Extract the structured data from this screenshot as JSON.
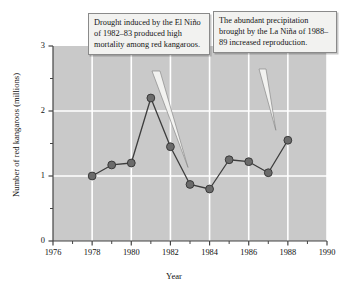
{
  "chart_data": {
    "type": "line",
    "title": "",
    "xlabel": "Year",
    "ylabel": "Number of red kangaroos (millions)",
    "xlim": [
      1976,
      1990
    ],
    "ylim": [
      0,
      3
    ],
    "grid": true,
    "legend": "none",
    "x_major_ticks": [
      1976,
      1978,
      1980,
      1982,
      1984,
      1986,
      1988,
      1990
    ],
    "x_minor_ticks": [
      1977,
      1979,
      1981,
      1983,
      1985,
      1987,
      1989
    ],
    "x_tick_labels": [
      "1976",
      "1978",
      "1980",
      "1982",
      "1984",
      "1986",
      "1988",
      "1990"
    ],
    "y_major_ticks": [
      0,
      1,
      2,
      3
    ],
    "y_minor_ticks": [
      0.5,
      1.5,
      2.5
    ],
    "y_tick_labels": [
      "0",
      "1",
      "2",
      "3"
    ],
    "marker_color": "#6b6b6b",
    "line_color": "#3d3d3d",
    "plot_background": "#c9c9c9",
    "gridline_color": "#ffffff",
    "x": [
      1978,
      1979,
      1980,
      1981,
      1982,
      1983,
      1984,
      1985,
      1986,
      1987,
      1988
    ],
    "values": [
      1.0,
      1.17,
      1.2,
      2.2,
      1.45,
      0.87,
      0.8,
      1.25,
      1.22,
      1.05,
      1.55
    ],
    "series": [
      {
        "name": "Red kangaroo population",
        "values": [
          1.0,
          1.17,
          1.2,
          2.2,
          1.45,
          0.87,
          0.8,
          1.25,
          1.22,
          1.05,
          1.55
        ]
      }
    ],
    "annotations": [
      {
        "id": "drought",
        "text": "Drought induced by the El Niño of 1982–83 produced high mortality among red kangaroos.",
        "points_to_year": 1983,
        "points_to_value": 0.87
      },
      {
        "id": "precipitation",
        "text": "The abundant precipitation brought by the La Niña of 1988–89 increased reproduction.",
        "points_to_year": 1988,
        "points_to_value": 1.55
      }
    ]
  }
}
